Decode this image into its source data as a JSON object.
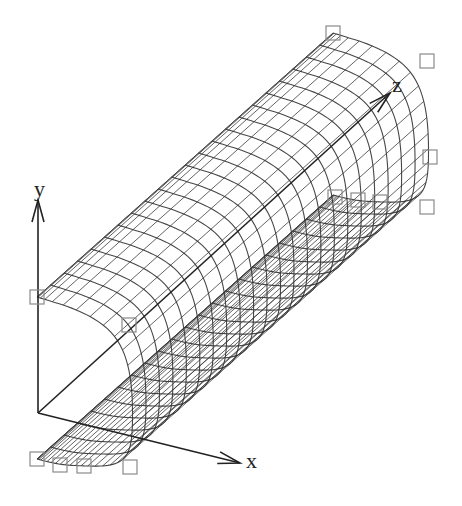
{
  "figure": {
    "background": "#ffffff",
    "mesh_color": "#333333",
    "control_point_color": "#8a8a8a",
    "axis_color": "#222222"
  },
  "axes": {
    "origin": [
      38,
      413
    ],
    "x": {
      "label": "x",
      "end": [
        240,
        463
      ],
      "label_pos": [
        246,
        450
      ]
    },
    "y": {
      "label": "y",
      "end": [
        38,
        200
      ],
      "label_pos": [
        34,
        178
      ]
    },
    "z": {
      "label": "z",
      "end": [
        390,
        93
      ],
      "label_pos": [
        392,
        74
      ]
    }
  },
  "surface": {
    "profile_control_points": [
      [
        37,
        297
      ],
      [
        129,
        325
      ],
      [
        134,
        421
      ],
      [
        130,
        467
      ],
      [
        84,
        466
      ],
      [
        60,
        465
      ],
      [
        37,
        459
      ]
    ],
    "sweep_offset": [
      296,
      -264
    ],
    "profile_segments": 40,
    "sweep_segments": 22
  },
  "control_points": {
    "box_size": 14,
    "points": [
      [
        37,
        297
      ],
      [
        129,
        325
      ],
      [
        37,
        459
      ],
      [
        60,
        465
      ],
      [
        84,
        466
      ],
      [
        130,
        467
      ],
      [
        333,
        33
      ],
      [
        427,
        61
      ],
      [
        430,
        157
      ],
      [
        427,
        207
      ],
      [
        335,
        197
      ],
      [
        358,
        200
      ],
      [
        380,
        202
      ]
    ]
  }
}
